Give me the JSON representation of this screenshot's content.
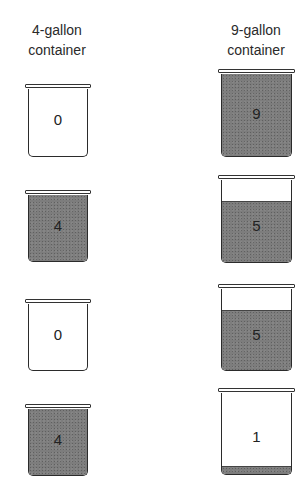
{
  "headers": {
    "small": [
      "4-gallon",
      "container"
    ],
    "large": [
      "9-gallon",
      "container"
    ]
  },
  "steps": [
    {
      "small": {
        "amount": "0",
        "capacity": 4
      },
      "large": {
        "amount": "9",
        "capacity": 9
      }
    },
    {
      "small": {
        "amount": "4",
        "capacity": 4
      },
      "large": {
        "amount": "5",
        "capacity": 9
      }
    },
    {
      "small": {
        "amount": "0",
        "capacity": 4
      },
      "large": {
        "amount": "5",
        "capacity": 9
      }
    },
    {
      "small": {
        "amount": "4",
        "capacity": 4
      },
      "large": {
        "amount": "1",
        "capacity": 9
      }
    }
  ],
  "colors": {
    "water": "#7d7d7d",
    "outline": "#2b2b2b",
    "background": "#ffffff"
  }
}
